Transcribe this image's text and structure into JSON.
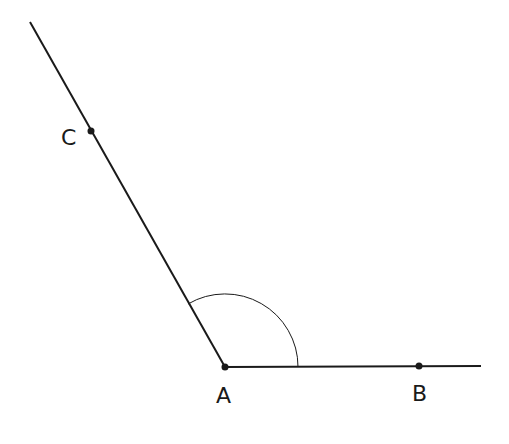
{
  "diagram": {
    "type": "angle",
    "vertex": {
      "label": "A",
      "x": 225,
      "y": 367
    },
    "points": [
      {
        "label": "B",
        "x": 419,
        "y": 366
      },
      {
        "label": "C",
        "x": 91,
        "y": 131
      }
    ],
    "rays": [
      {
        "from": "A",
        "through": "B",
        "end": [
          481,
          366
        ]
      },
      {
        "from": "A",
        "through": "C",
        "end": [
          30,
          22
        ]
      }
    ],
    "arc": {
      "center": "A",
      "radius": 73,
      "angle_name": "BAC"
    },
    "labels": {
      "A": "A",
      "B": "B",
      "C": "C"
    },
    "stroke_color": "#1a1a1a"
  }
}
